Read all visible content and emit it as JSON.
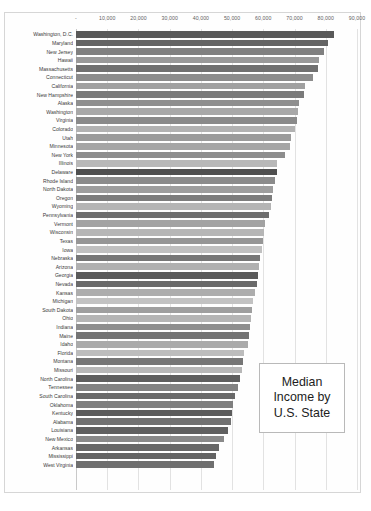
{
  "title_box": {
    "lines": [
      "Median",
      "Income by",
      "U.S. State"
    ]
  },
  "footer": {
    "text": ""
  },
  "chart_data": {
    "type": "bar",
    "orientation": "horizontal",
    "xlabel": "",
    "ylabel": "",
    "xlim": [
      0,
      90000
    ],
    "grid": true,
    "legend_position": "inside-right",
    "tick_labels": [
      "-",
      "10,000",
      "20,000",
      "30,000",
      "40,000",
      "50,000",
      "60,000",
      "70,000",
      "80,000",
      "90,000"
    ],
    "tick_values": [
      0,
      10000,
      20000,
      30000,
      40000,
      50000,
      60000,
      70000,
      80000,
      90000
    ],
    "categories": [
      "Washington, D.C.",
      "Maryland",
      "New Jersey",
      "Hawaii",
      "Massachusetts",
      "Connecticut",
      "California",
      "New Hampshire",
      "Alaska",
      "Washington",
      "Virginia",
      "Colorado",
      "Utah",
      "Minnesota",
      "New York",
      "Illinois",
      "Delaware",
      "Rhode Island",
      "North Dakota",
      "Oregon",
      "Wyoming",
      "Pennsylvania",
      "Vermont",
      "Wisconsin",
      "Texas",
      "Iowa",
      "Nebraska",
      "Arizona",
      "Georgia",
      "Nevada",
      "Kansas",
      "Michigan",
      "South Dakota",
      "Ohio",
      "Indiana",
      "Maine",
      "Idaho",
      "Florida",
      "Montana",
      "Missouri",
      "North Carolina",
      "Tennessee",
      "South Carolina",
      "Oklahoma",
      "Kentucky",
      "Alabama",
      "Louisiana",
      "New Mexico",
      "Arkansas",
      "Mississippi",
      "West Virginia"
    ],
    "values": [
      82604,
      80776,
      79363,
      77765,
      77378,
      75923,
      73220,
      73115,
      71583,
      70979,
      70784,
      70280,
      69002,
      68450,
      66997,
      64480,
      64312,
      63716,
      63000,
      62818,
      62539,
      61744,
      60567,
      60275,
      59795,
      59588,
      59009,
      58629,
      58295,
      57927,
      57422,
      56697,
      56497,
      56016,
      55663,
      55425,
      55072,
      53940,
      53386,
      53135,
      52434,
      51869,
      51015,
      50308,
      49997,
      49498,
      48817,
      47497,
      45726,
      44818,
      44235
    ],
    "bar_shades": [
      "#595959",
      "#636363",
      "#808080",
      "#999999",
      "#707070",
      "#8c8c8c",
      "#a0a0a0",
      "#7a7a7a",
      "#8f8f8f",
      "#a8a8a8",
      "#8a8a8a",
      "#b2b2b2",
      "#9b9b9b",
      "#a5a5a5",
      "#8d8d8d",
      "#b8b8b8",
      "#4f4f4f",
      "#8b8b8b",
      "#9e9e9e",
      "#7d7d7d",
      "#b4b4b4",
      "#6e6e6e",
      "#a2a2a2",
      "#b6b6b6",
      "#969696",
      "#c0c0c0",
      "#777777",
      "#b0b0b0",
      "#5a5a5a",
      "#6a6a6a",
      "#adadad",
      "#c2c2c2",
      "#9f9f9f",
      "#b5b5b5",
      "#8e8e8e",
      "#747474",
      "#aaaaaa",
      "#bcbcbc",
      "#767676",
      "#b7b7b7",
      "#5e5e5e",
      "#828282",
      "#696969",
      "#7f7f7f",
      "#5c5c5c",
      "#717171",
      "#606060",
      "#8a8a8a",
      "#686868",
      "#636363",
      "#6f6f6f"
    ]
  }
}
